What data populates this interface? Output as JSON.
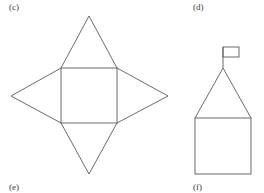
{
  "labels": {
    "c": "(c)",
    "d": "(d)",
    "e": "(e)",
    "f": "(f)"
  },
  "figures": [
    {
      "id": "square-pyramid-net",
      "description": "Net of a square pyramid: central square with four triangles attached to each side",
      "square": {
        "x1": 61,
        "y1": 68,
        "x2": 117,
        "y2": 123
      },
      "apexes": {
        "top": [
          89,
          16
        ],
        "left": [
          11,
          96
        ],
        "right": [
          168,
          96
        ],
        "bottom": [
          89,
          174
        ]
      }
    },
    {
      "id": "house-with-flag",
      "description": "House shape: square base with triangular roof and a flag on top",
      "base": {
        "x1": 195,
        "y1": 118,
        "x2": 251,
        "y2": 174
      },
      "roof_apex": [
        223,
        68
      ],
      "flag_pole": {
        "x": 223,
        "y1": 47,
        "y2": 68
      },
      "flag": {
        "x1": 223,
        "y1": 47,
        "x2": 239,
        "y2": 57
      }
    }
  ],
  "colors": {
    "line": "#5a5a5a",
    "text": "#3a3a3a",
    "background": "#ffffff"
  }
}
